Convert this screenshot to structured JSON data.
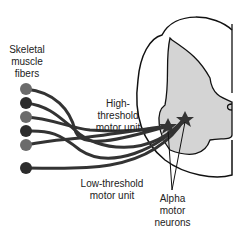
{
  "labels": {
    "fibers": "Skeletal\nmuscle\nfibers",
    "high": "High-\nthreshold\nmotor unit",
    "low": "Low-threshold\nmotor unit",
    "alpha": "Alpha\nmotor\nneurons"
  },
  "colors": {
    "light_fiber": "#6b6b6b",
    "dark_fiber": "#2c2c2c",
    "gray_matter": "#d4d4d4",
    "outline": "#111111",
    "axon": "#333333"
  }
}
